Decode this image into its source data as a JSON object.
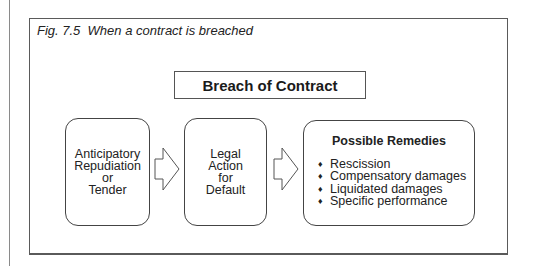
{
  "figure": {
    "caption": "Fig. 7.5  When a contract is breached",
    "title": "Breach of Contract",
    "stages": [
      {
        "lines": [
          "Anticipatory",
          "Repudiation",
          "or",
          "Tender"
        ]
      },
      {
        "lines": [
          "Legal",
          "Action",
          "for",
          "Default"
        ]
      }
    ],
    "remedies": {
      "title": "Possible Remedies",
      "bullet_glyph": "♦",
      "items": [
        "Rescission",
        "Compensatory damages",
        "Liquidated damages",
        "Specific performance"
      ]
    },
    "colors": {
      "border": "#444444",
      "text": "#222222",
      "background": "#ffffff"
    }
  }
}
